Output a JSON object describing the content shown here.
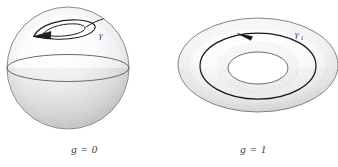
{
  "figure": {
    "background_color": "#ffffff",
    "outline_color": "#555555",
    "curve_color": "#1e1e1e",
    "shade_color": "#b9b9b9",
    "text_color": "#3a3a3a",
    "panels": [
      {
        "id": "sphere-panel",
        "shape_name": "sphere",
        "caption": "g = 0",
        "genus_label": "g",
        "genus_value": "0",
        "loop_label": "γ",
        "loop_description": "contractible loop on sphere",
        "arrow_direction": "left",
        "center_x": 68,
        "center_y": 68,
        "radius": 61,
        "equator_y": 68
      },
      {
        "id": "torus-panel",
        "shape_name": "torus",
        "caption": "g = 1",
        "genus_label": "g",
        "genus_value": "1",
        "loop_label": "γ",
        "loop_subscript": "1",
        "loop_description": "non-contractible loop around torus hole",
        "arrow_direction": "left",
        "center_x": 258,
        "center_y": 65,
        "outer_rx": 80,
        "outer_ry": 47,
        "hole_rx": 30,
        "hole_ry": 16
      }
    ]
  }
}
